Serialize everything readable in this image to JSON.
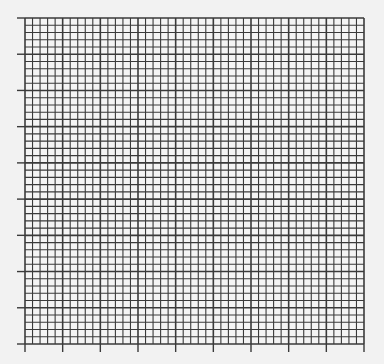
{
  "graph_paper": {
    "left": 25,
    "top": 18,
    "right": 364,
    "bottom": 344,
    "cols": 45,
    "rows": 45,
    "major_every": 5,
    "tick_length": 8,
    "line_color": "#3a3a3a",
    "background": "#f2f2f2",
    "cell_fill": "#f4f4f4"
  }
}
